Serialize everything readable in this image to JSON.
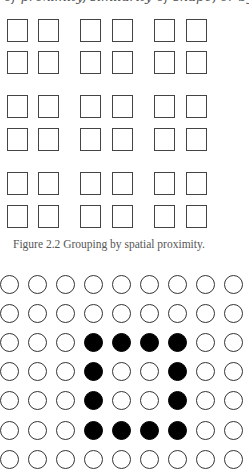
{
  "top_text": "of proximity, similarity of shape, or by closing gaps",
  "figure_squares": {
    "rows": 6,
    "cols": 6,
    "col_x": [
      7,
      38,
      80,
      112,
      154,
      186
    ],
    "row_y": [
      19,
      51,
      95,
      128,
      172,
      205
    ],
    "caption": "Figure 2.2  Grouping by spatial proximity."
  },
  "figure_circles": {
    "rows": 7,
    "cols": 9,
    "col_x": [
      0,
      28,
      56,
      84,
      112,
      140,
      168,
      196,
      224
    ],
    "row_y": [
      275,
      304,
      333,
      362,
      391,
      421,
      450
    ],
    "filled": [
      [
        0,
        0,
        0,
        0,
        0,
        0,
        0,
        0,
        0
      ],
      [
        0,
        0,
        0,
        0,
        0,
        0,
        0,
        0,
        0
      ],
      [
        0,
        0,
        0,
        1,
        1,
        1,
        1,
        0,
        0
      ],
      [
        0,
        0,
        0,
        1,
        0,
        0,
        1,
        0,
        0
      ],
      [
        0,
        0,
        0,
        1,
        0,
        0,
        1,
        0,
        0
      ],
      [
        0,
        0,
        0,
        1,
        1,
        1,
        1,
        0,
        0
      ],
      [
        0,
        0,
        0,
        0,
        0,
        0,
        0,
        0,
        0
      ]
    ]
  }
}
